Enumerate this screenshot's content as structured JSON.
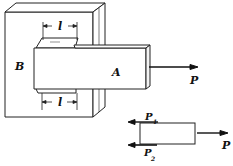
{
  "diagram": {
    "type": "mechanical-joint",
    "labels": {
      "block_b": "B",
      "bar_a": "A",
      "force": "P",
      "length_top": "l",
      "length_bottom": "l",
      "force_1": "P",
      "force_1_sub": "1",
      "force_2": "P",
      "force_2_sub": "2",
      "fbd_force": "P"
    },
    "colors": {
      "stroke": "#222222",
      "background": "#ffffff"
    }
  }
}
